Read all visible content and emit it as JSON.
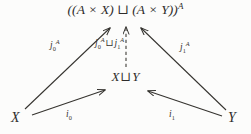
{
  "diagram": {
    "type": "commutative-diagram",
    "background_color": "#fcfcfb",
    "ink_color": "#2e2c2b",
    "nodes": [
      {
        "id": "top",
        "name": "codomain-object",
        "text": "((A × X) ⊔ (A × Y))",
        "base": "((A × X) ⊔ (A × Y))",
        "exponent": "A",
        "position": "top-center"
      },
      {
        "id": "mid",
        "name": "coproduct-object",
        "text": "X ⊔ Y",
        "left": "X",
        "operator": "⊔",
        "right": "Y",
        "position": "center"
      },
      {
        "id": "left",
        "name": "source-object-x",
        "text": "X",
        "position": "bottom-left"
      },
      {
        "id": "right",
        "name": "source-object-y",
        "text": "Y",
        "position": "bottom-right"
      }
    ],
    "arrows": [
      {
        "id": "j0",
        "name": "arrow-j0",
        "from": "X",
        "to": "((A × X) ⊔ (A × Y))^A",
        "style": "solid",
        "label_base": "j",
        "label_sub": "0",
        "label_sup": "A"
      },
      {
        "id": "j1",
        "name": "arrow-j1",
        "from": "Y",
        "to": "((A × X) ⊔ (A × Y))^A",
        "style": "solid",
        "label_base": "j",
        "label_sub": "1",
        "label_sup": "A"
      },
      {
        "id": "jj",
        "name": "arrow-induced-coproduct-map",
        "from": "X ⊔ Y",
        "to": "((A × X) ⊔ (A × Y))^A",
        "style": "dashed",
        "label_base_left": "j",
        "label_sub_left": "0",
        "label_sup_left": "A",
        "label_operator": "⊔",
        "label_base_right": "j",
        "label_sub_right": "1",
        "label_sup_right": "A"
      },
      {
        "id": "i0",
        "name": "arrow-i0",
        "from": "X",
        "to": "X ⊔ Y",
        "style": "solid",
        "label_base": "i",
        "label_sub": "0"
      },
      {
        "id": "i1",
        "name": "arrow-i1",
        "from": "Y",
        "to": "X ⊔ Y",
        "style": "solid",
        "label_base": "i",
        "label_sub": "1"
      }
    ]
  }
}
